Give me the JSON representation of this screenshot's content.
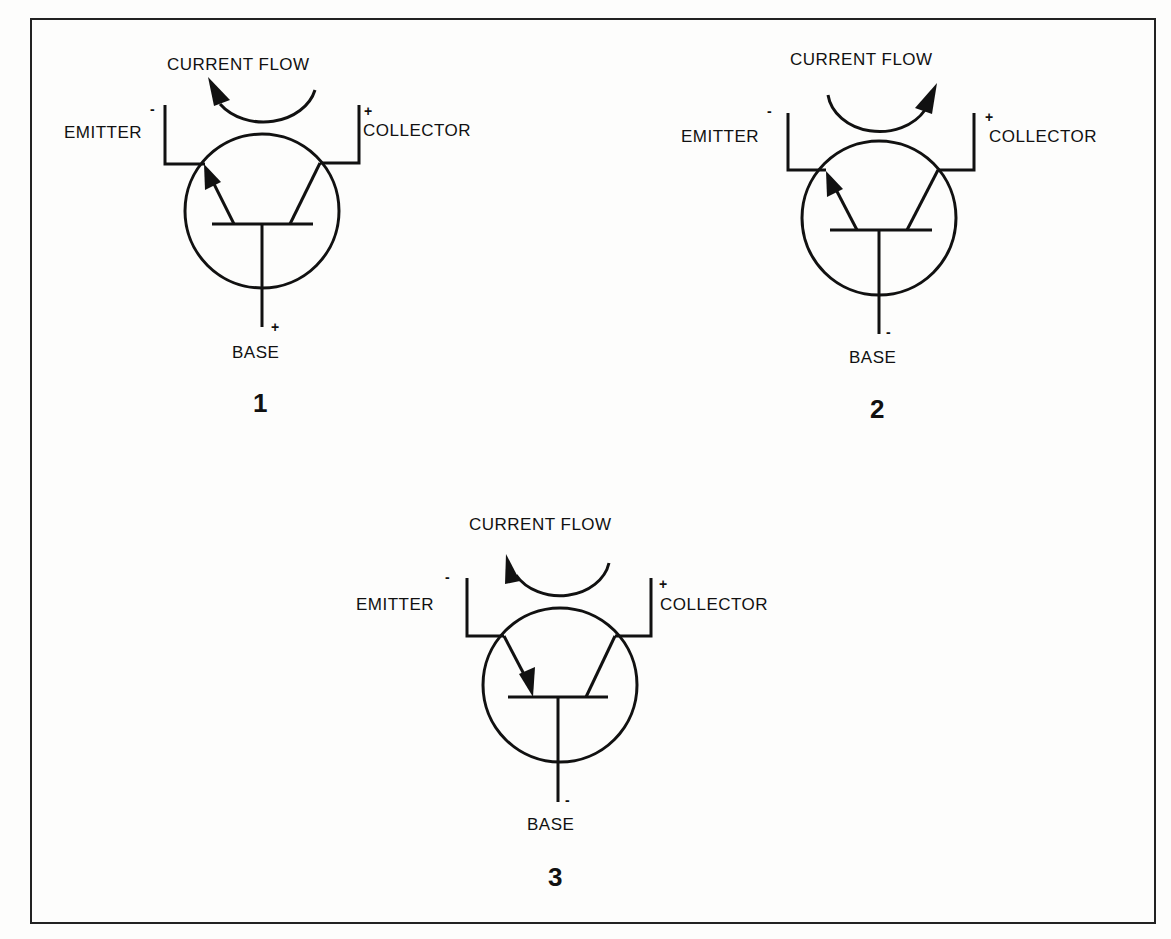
{
  "figure": {
    "border_color": "#222222",
    "line_color": "#111111",
    "background": "#fdfdfc"
  },
  "diagrams": [
    {
      "number": "1",
      "current_flow_label": "CURRENT FLOW",
      "current_flow_direction": "collector-to-emitter (arrow at emitter side)",
      "emitter": {
        "label": "EMITTER",
        "polarity": "-"
      },
      "collector": {
        "label": "COLLECTOR",
        "polarity": "+"
      },
      "base": {
        "label": "BASE",
        "polarity": "+"
      },
      "emitter_arrow": "outward"
    },
    {
      "number": "2",
      "current_flow_label": "CURRENT FLOW",
      "current_flow_direction": "emitter-to-collector (arrow at collector side)",
      "emitter": {
        "label": "EMITTER",
        "polarity": "-"
      },
      "collector": {
        "label": "COLLECTOR",
        "polarity": "+"
      },
      "base": {
        "label": "BASE",
        "polarity": "-"
      },
      "emitter_arrow": "outward"
    },
    {
      "number": "3",
      "current_flow_label": "CURRENT FLOW",
      "current_flow_direction": "collector-to-emitter (arrow at emitter side)",
      "emitter": {
        "label": "EMITTER",
        "polarity": "-"
      },
      "collector": {
        "label": "COLLECTOR",
        "polarity": "+"
      },
      "base": {
        "label": "BASE",
        "polarity": "-"
      },
      "emitter_arrow": "inward"
    }
  ]
}
